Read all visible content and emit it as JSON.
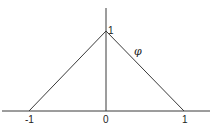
{
  "diagram": {
    "type": "hat function plot",
    "function_label": "φ",
    "peak_label": "1",
    "x_ticks": [
      {
        "label": "-1",
        "x": 29
      },
      {
        "label": "0",
        "x": 106
      },
      {
        "label": "1",
        "x": 184
      }
    ],
    "points": [
      {
        "x": -1,
        "y": 0
      },
      {
        "x": 0,
        "y": 1
      },
      {
        "x": 1,
        "y": 0
      }
    ],
    "colors": {
      "line": "#3a3a3a",
      "text": "#222222",
      "background": "#ffffff"
    }
  }
}
